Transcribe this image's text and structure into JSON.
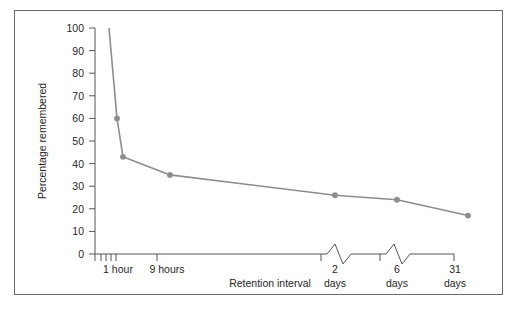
{
  "figure": {
    "frame_border_color": "#6b6b6b",
    "background_color": "#ffffff"
  },
  "chart_data": {
    "type": "line",
    "title": "",
    "subtitle": "",
    "xlabel": "Retention interval",
    "ylabel": "Percentage remembered",
    "ylim": [
      0,
      100
    ],
    "ytick_values": [
      0,
      10,
      20,
      30,
      40,
      50,
      60,
      70,
      80,
      90,
      100
    ],
    "ytick_labels": [
      "0",
      "10",
      "20",
      "30",
      "40",
      "50",
      "60",
      "70",
      "80",
      "90",
      "100"
    ],
    "xtick_labels": [
      "1 hour",
      "9 hours",
      "2\ndays",
      "6\ndays",
      "31\ndays"
    ],
    "xtick_labels_lines": [
      [
        "1 hour"
      ],
      [
        "9 hours"
      ],
      [
        "2",
        "days"
      ],
      [
        "6",
        "days"
      ],
      [
        "31",
        "days"
      ]
    ],
    "grid": false,
    "legend": false,
    "legend_position": "none",
    "axis_breaks": 2,
    "series": [
      {
        "name": "Percentage remembered",
        "color": "#8d8d8d",
        "marker": "circle",
        "points": [
          {
            "x_label": "0",
            "x_px": 94,
            "value": 100,
            "marker": false
          },
          {
            "x_label": "20 minutes",
            "x_px": 102,
            "value": 60,
            "marker": true
          },
          {
            "x_label": "1 hour",
            "x_px": 108,
            "value": 43,
            "marker": true
          },
          {
            "x_label": "9 hours",
            "x_px": 155,
            "value": 35,
            "marker": true
          },
          {
            "x_label": "2 days",
            "x_px": 320,
            "value": 26,
            "marker": true
          },
          {
            "x_label": "6 days",
            "x_px": 382,
            "value": 24,
            "marker": true
          },
          {
            "x_label": "31 days",
            "x_px": 453,
            "value": 17,
            "marker": true
          }
        ]
      }
    ],
    "annotations": []
  }
}
